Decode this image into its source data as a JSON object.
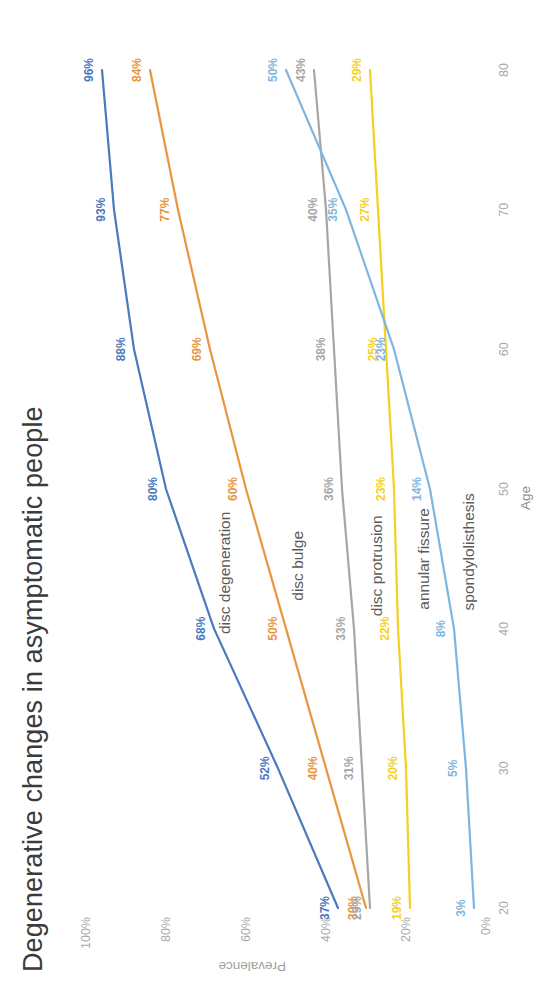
{
  "title": "Degenerative changes in asymptomatic people",
  "axes": {
    "x_label": "Age",
    "y_label": "Prevalence",
    "x_ticks": [
      "20",
      "30",
      "40",
      "50",
      "60",
      "70",
      "80"
    ],
    "y_ticks": [
      "0%",
      "20%",
      "40%",
      "60%",
      "80%",
      "100%"
    ]
  },
  "chart_data": {
    "type": "line",
    "title": "Degenerative changes in asymptomatic people",
    "xlabel": "Age",
    "ylabel": "Prevalence",
    "x": [
      20,
      30,
      40,
      50,
      60,
      70,
      80
    ],
    "xlim": [
      20,
      80
    ],
    "ylim": [
      0,
      100
    ],
    "grid": false,
    "legend": "inline-series-labels",
    "series": [
      {
        "name": "disc degeneration",
        "color": "#4A79BE",
        "values": [
          37,
          52,
          68,
          80,
          88,
          93,
          96
        ],
        "labels": [
          "37%",
          "52%",
          "68%",
          "80%",
          "88%",
          "93%",
          "96%"
        ]
      },
      {
        "name": "disc bulge",
        "color": "#E8953E",
        "values": [
          30,
          40,
          50,
          60,
          69,
          77,
          84
        ],
        "labels": [
          "30%",
          "40%",
          "50%",
          "60%",
          "69%",
          "77%",
          "84%"
        ]
      },
      {
        "name": "disc protrusion",
        "color": "#A6A6A6",
        "values": [
          29,
          31,
          33,
          36,
          38,
          40,
          43
        ],
        "labels": [
          "29%",
          "31%",
          "33%",
          "36%",
          "38%",
          "40%",
          "43%"
        ]
      },
      {
        "name": "annular fissure",
        "color": "#F5D020",
        "values": [
          19,
          20,
          22,
          23,
          25,
          27,
          29
        ],
        "labels": [
          "19%",
          "20%",
          "22%",
          "23%",
          "25%",
          "27%",
          "29%"
        ]
      },
      {
        "name": "spondylolisthesis",
        "color": "#7FB6E0",
        "values": [
          3,
          5,
          8,
          14,
          23,
          35,
          50
        ],
        "labels": [
          "3%",
          "5%",
          "8%",
          "14%",
          "23%",
          "35%",
          "50%"
        ]
      }
    ]
  }
}
